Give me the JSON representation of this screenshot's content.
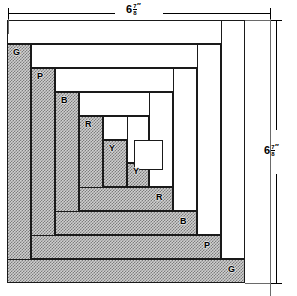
{
  "diagram": {
    "block": {
      "x": 7,
      "y": 20,
      "width": 238,
      "height": 263,
      "center": {
        "x": 134,
        "y": 140,
        "width": 29,
        "height": 30,
        "fill": "plain"
      }
    },
    "colors": {
      "outline": "#1a1a1a",
      "shaded_fill": "#9a9a9a",
      "plain_fill": "#ffffff",
      "dimension": "#000000",
      "extension": "#6a6a6a"
    },
    "legend_note": "G = Green, P = Purple, B = Blue, R = Red, Y = Yellow",
    "logs": [
      {
        "id": "g-left",
        "label": "G",
        "fill": "shaded",
        "x": 7,
        "y": 44,
        "w": 24,
        "h": 239,
        "label_x": 13,
        "label_y": 48
      },
      {
        "id": "g-top",
        "label": "",
        "fill": "plain",
        "x": 7,
        "y": 20,
        "w": 238,
        "h": 24,
        "label_x": 0,
        "label_y": 0
      },
      {
        "id": "g-right",
        "label": "",
        "fill": "plain",
        "x": 221,
        "y": 20,
        "w": 24,
        "h": 239,
        "label_x": 0,
        "label_y": 0
      },
      {
        "id": "g-bottom",
        "label": "G",
        "fill": "shaded",
        "x": 7,
        "y": 259,
        "w": 238,
        "h": 24,
        "label_x": 228,
        "label_y": 265
      },
      {
        "id": "p-left",
        "label": "P",
        "fill": "shaded",
        "x": 31,
        "y": 68,
        "w": 24,
        "h": 191,
        "label_x": 37,
        "label_y": 72
      },
      {
        "id": "p-top",
        "label": "",
        "fill": "plain",
        "x": 31,
        "y": 44,
        "w": 190,
        "h": 24,
        "label_x": 0,
        "label_y": 0
      },
      {
        "id": "p-right",
        "label": "",
        "fill": "plain",
        "x": 197,
        "y": 44,
        "w": 24,
        "h": 191,
        "label_x": 0,
        "label_y": 0
      },
      {
        "id": "p-bottom",
        "label": "P",
        "fill": "shaded",
        "x": 31,
        "y": 235,
        "w": 190,
        "h": 24,
        "label_x": 204,
        "label_y": 241
      },
      {
        "id": "b-left",
        "label": "B",
        "fill": "shaded",
        "x": 55,
        "y": 92,
        "w": 24,
        "h": 143,
        "label_x": 61,
        "label_y": 96
      },
      {
        "id": "b-top",
        "label": "",
        "fill": "plain",
        "x": 55,
        "y": 68,
        "w": 142,
        "h": 24,
        "label_x": 0,
        "label_y": 0
      },
      {
        "id": "b-right",
        "label": "",
        "fill": "plain",
        "x": 173,
        "y": 68,
        "w": 24,
        "h": 143,
        "label_x": 0,
        "label_y": 0
      },
      {
        "id": "b-bottom",
        "label": "B",
        "fill": "shaded",
        "x": 55,
        "y": 211,
        "w": 142,
        "h": 24,
        "label_x": 180,
        "label_y": 217
      },
      {
        "id": "r-left",
        "label": "R",
        "fill": "shaded",
        "x": 79,
        "y": 116,
        "w": 24,
        "h": 95,
        "label_x": 85,
        "label_y": 120
      },
      {
        "id": "r-top",
        "label": "",
        "fill": "plain",
        "x": 79,
        "y": 92,
        "w": 94,
        "h": 24,
        "label_x": 0,
        "label_y": 0
      },
      {
        "id": "r-right",
        "label": "",
        "fill": "plain",
        "x": 149,
        "y": 92,
        "w": 24,
        "h": 95,
        "label_x": 0,
        "label_y": 0
      },
      {
        "id": "r-bottom",
        "label": "R",
        "fill": "shaded",
        "x": 79,
        "y": 187,
        "w": 94,
        "h": 24,
        "label_x": 156,
        "label_y": 193
      },
      {
        "id": "y-left",
        "label": "Y",
        "fill": "shaded",
        "x": 103,
        "y": 140,
        "w": 24,
        "h": 47,
        "label_x": 109,
        "label_y": 144
      },
      {
        "id": "y-top",
        "label": "",
        "fill": "plain",
        "x": 103,
        "y": 116,
        "w": 46,
        "h": 24,
        "label_x": 0,
        "label_y": 0
      },
      {
        "id": "y-right",
        "label": "",
        "fill": "plain",
        "x": 127,
        "y": 116,
        "w": 22,
        "h": 47,
        "label_x": 0,
        "label_y": 0
      },
      {
        "id": "y-bottom",
        "label": "Y",
        "fill": "shaded",
        "x": 127,
        "y": 163,
        "w": 22,
        "h": 24,
        "label_x": 133,
        "label_y": 167
      }
    ],
    "dimensions": {
      "top": {
        "value": "6",
        "fraction_numerator": "7",
        "fraction_denominator": "8",
        "unit": "″",
        "line_y": 13,
        "line_x1": 8,
        "line_x2": 270,
        "label_x": 126,
        "label_y": 4
      },
      "right": {
        "value": "6",
        "fraction_numerator": "7",
        "fraction_denominator": "8",
        "unit": "″",
        "line_x": 276,
        "line_y1": 20,
        "line_y2": 283,
        "label_x": 264,
        "label_y": 145
      }
    }
  }
}
